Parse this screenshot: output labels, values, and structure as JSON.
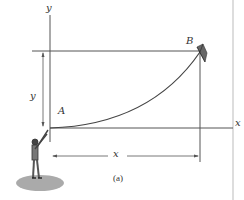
{
  "diagram": {
    "labels": {
      "y_axis": "y",
      "x_axis": "x",
      "point_a": "A",
      "point_b": "B",
      "y_dimension": "y",
      "x_dimension": "x",
      "caption": "(a)"
    },
    "colors": {
      "line": "#555555",
      "string": "#444444",
      "ground": "#aaaaaa",
      "border": "#bbbbbb"
    }
  }
}
